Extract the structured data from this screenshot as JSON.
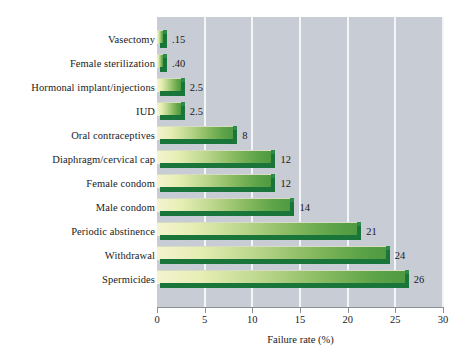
{
  "chart_data": {
    "type": "bar",
    "orientation": "horizontal",
    "title": "",
    "xlabel": "Failure rate (%)",
    "ylabel": "",
    "xlim": [
      0,
      30
    ],
    "xticks": [
      "0",
      "5",
      "10",
      "15",
      "20",
      "25",
      "30"
    ],
    "grid": "vertical white gridlines at each x tick",
    "legend": "none",
    "categories": [
      "Vasectomy",
      "Female sterilization",
      "Hormonal implant/injections",
      "IUD",
      "Oral contraceptives",
      "Diaphragm/cervical cap",
      "Female condom",
      "Male condom",
      "Periodic abstinence",
      "Withdrawal",
      "Spermicides"
    ],
    "values": [
      0.15,
      0.4,
      2.5,
      2.5,
      8,
      12,
      12,
      14,
      21,
      24,
      26
    ],
    "value_labels": [
      ".15",
      ".40",
      "2.5",
      "2.5",
      "8",
      "12",
      "12",
      "14",
      "21",
      "24",
      "26"
    ],
    "colors": {
      "plot_background": "#c8ccd4",
      "gridline": "#f4f5f7",
      "bar_gradient_start": "#f4f3cf",
      "bar_gradient_end": "#4f9a42",
      "bar_bevel": "#19753a",
      "axis": "#8b8f96",
      "text": "#1a1a1a",
      "page_background": "#ffffff"
    }
  }
}
